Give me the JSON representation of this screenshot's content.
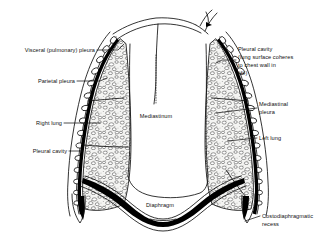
{
  "figure": {
    "background_color": "#ffffff",
    "ink_color": "#000000",
    "lung_fill_color": "#f2f2f0",
    "width": 327,
    "height": 238
  },
  "labels": {
    "visceral_pleura": "Visceral (pulmonary) pleura",
    "parietal_pleura": "Parietal pleura",
    "right_lung": "Right lung",
    "pleural_cavity_left_side": "Pleural cavity",
    "mediastinum": "Mediastinum",
    "diaphragm": "Diaphragm",
    "pleural_cavity_note_line1": "Pleural cavity",
    "pleural_cavity_note_line2": "(lung surface coheres",
    "pleural_cavity_note_line3": "to chest wall in",
    "pleural_cavity_note_line4": "life)",
    "mediastinal_pleura_line1": "Mediastinal",
    "mediastinal_pleura_line2": "pleura",
    "left_lung": "Left lung",
    "costodiaphragmatic_recess_line1": "Costodiaphragmatic",
    "costodiaphragmatic_recess_line2": "recess"
  },
  "structures": {
    "right_lung": "right lung",
    "left_lung": "left lung",
    "mediastinum": "mediastinum",
    "diaphragm": "diaphragm",
    "chest_wall": "chest wall with ribs",
    "visceral_pleura": "visceral pleura",
    "parietal_pleura": "parietal pleura",
    "costodiaphragmatic_recess": "costodiaphragmatic recess",
    "trachea": "trachea and neck outline"
  }
}
